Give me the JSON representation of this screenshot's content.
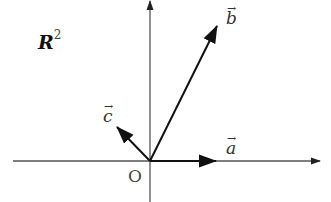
{
  "space_label": {
    "base": "R",
    "exponent": "2"
  },
  "origin_label": "O",
  "vectors": [
    {
      "name": "a",
      "label": "a",
      "arrow": "→",
      "from": [
        150,
        161
      ],
      "to": [
        216,
        161
      ]
    },
    {
      "name": "b",
      "label": "b",
      "arrow": "→",
      "from": [
        150,
        161
      ],
      "to": [
        217,
        26
      ]
    },
    {
      "name": "c",
      "label": "c",
      "arrow": "→",
      "from": [
        150,
        161
      ],
      "to": [
        117,
        127
      ]
    }
  ],
  "axes": {
    "x": {
      "from": [
        13,
        161
      ],
      "to": [
        320,
        161
      ]
    },
    "y": {
      "from": [
        150,
        202
      ],
      "to": [
        150,
        0
      ]
    }
  },
  "colors": {
    "axis": "#555555",
    "vector": "#111111",
    "text": "#333333"
  }
}
